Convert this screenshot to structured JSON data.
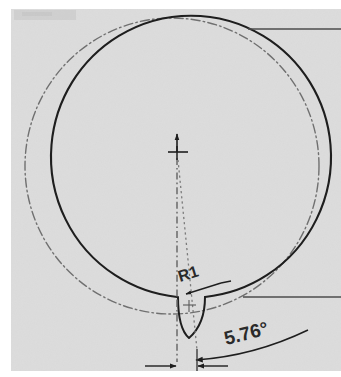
{
  "drawing": {
    "type": "engineering-section-view",
    "background_color": "#dcdcdc",
    "page_color": "#ffffff",
    "line_color": "#1e1e1e",
    "reference_line_color": "#6e6e6e",
    "title": "",
    "annotations": {
      "radius_label": "R1",
      "angle_label": "5.76°"
    },
    "geometry": {
      "profile_circle": {
        "name": "machined-profile",
        "style": "solid",
        "center_x": 175,
        "center_y": 169,
        "radius_x": 140,
        "radius_y": 141
      },
      "reference_circle": {
        "name": "nominal-reference-circle",
        "style": "dash-dot",
        "center_x": 172,
        "center_y": 166,
        "radius_x": 147,
        "radius_y": 148
      },
      "notch": {
        "name": "keyway-notch",
        "apex_y": 339,
        "top_y": 297,
        "left_x": 178,
        "right_x": 205
      },
      "center_mark": {
        "x": 177,
        "y": 152
      },
      "extension_lines": [
        {
          "name": "top-extension-line",
          "y": 29,
          "x1": 248,
          "x2": 341
        },
        {
          "name": "notch-extension-line",
          "y": 297,
          "x1": 243,
          "x2": 341
        }
      ]
    },
    "dimensions": [
      {
        "name": "angular-dimension",
        "value": "5.76°",
        "kind": "angle",
        "arrow_count": 2
      },
      {
        "name": "radius-dimension",
        "value": "R1",
        "kind": "radius",
        "leader": true
      },
      {
        "name": "linear-offset-dimension",
        "kind": "linear",
        "arrow_count": 2,
        "y": 366
      }
    ]
  }
}
